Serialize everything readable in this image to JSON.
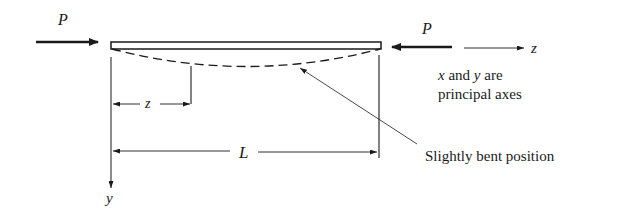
{
  "diagram": {
    "type": "column-buckling",
    "labels": {
      "load_left": "P",
      "load_right": "P",
      "axis_z": "z",
      "axis_y": "y",
      "dim_z": "z",
      "dim_L": "L",
      "note_line1_x": "x",
      "note_line1_mid": " and ",
      "note_line1_y": "y",
      "note_line1_end": " are",
      "note_line2": "principal axes",
      "bent_label": "Slightly bent position"
    },
    "colors": {
      "line": "#1a1a1a",
      "background": "#ffffff"
    }
  }
}
